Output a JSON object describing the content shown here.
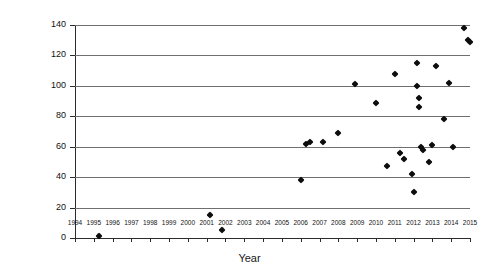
{
  "chart_data": {
    "type": "scatter",
    "title": "",
    "xlabel": "Year",
    "ylabel": "Power efficiency (lm/W)",
    "xlim": [
      1994,
      2015
    ],
    "ylim": [
      0,
      140
    ],
    "grid": "horizontal",
    "legend": "none",
    "xticks": [
      1994,
      1995,
      1996,
      1997,
      1998,
      1999,
      2000,
      2001,
      2002,
      2003,
      2004,
      2005,
      2006,
      2007,
      2008,
      2009,
      2010,
      2011,
      2012,
      2013,
      2014,
      2015
    ],
    "yticks": [
      0,
      20,
      40,
      60,
      80,
      100,
      120,
      140
    ],
    "marker": "diamond",
    "marker_color": "#0d0d0d",
    "points": [
      {
        "x": 1995.3,
        "y": 1
      },
      {
        "x": 2001.2,
        "y": 15
      },
      {
        "x": 2001.8,
        "y": 5
      },
      {
        "x": 2006.0,
        "y": 38
      },
      {
        "x": 2006.3,
        "y": 62
      },
      {
        "x": 2006.5,
        "y": 63
      },
      {
        "x": 2007.2,
        "y": 63
      },
      {
        "x": 2008.0,
        "y": 69
      },
      {
        "x": 2008.9,
        "y": 101
      },
      {
        "x": 2010.0,
        "y": 89
      },
      {
        "x": 2010.6,
        "y": 47
      },
      {
        "x": 2011.0,
        "y": 108
      },
      {
        "x": 2011.3,
        "y": 56
      },
      {
        "x": 2011.5,
        "y": 52
      },
      {
        "x": 2011.9,
        "y": 42
      },
      {
        "x": 2012.0,
        "y": 30
      },
      {
        "x": 2012.2,
        "y": 115
      },
      {
        "x": 2012.2,
        "y": 100
      },
      {
        "x": 2012.3,
        "y": 92
      },
      {
        "x": 2012.3,
        "y": 86
      },
      {
        "x": 2012.4,
        "y": 60
      },
      {
        "x": 2012.5,
        "y": 58
      },
      {
        "x": 2012.8,
        "y": 50
      },
      {
        "x": 2013.0,
        "y": 61
      },
      {
        "x": 2013.2,
        "y": 113
      },
      {
        "x": 2013.6,
        "y": 78
      },
      {
        "x": 2013.9,
        "y": 102
      },
      {
        "x": 2014.1,
        "y": 60
      },
      {
        "x": 2014.7,
        "y": 138
      },
      {
        "x": 2014.9,
        "y": 130
      },
      {
        "x": 2015.0,
        "y": 129
      }
    ]
  }
}
